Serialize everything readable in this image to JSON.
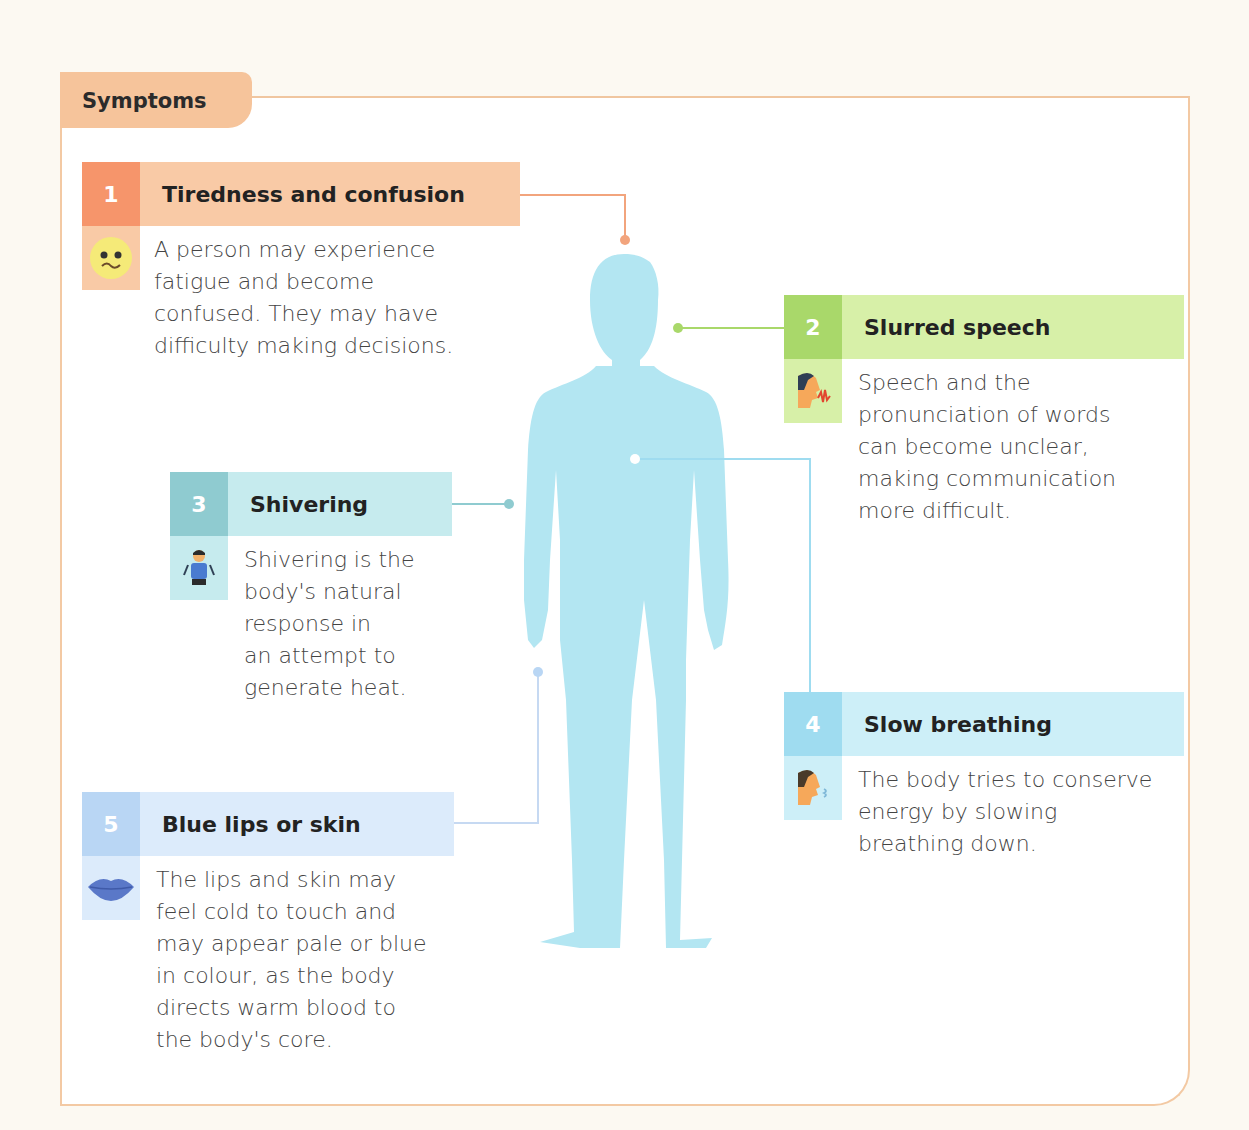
{
  "section": {
    "title": "Symptoms"
  },
  "colors": {
    "frame": "#f3c9a3",
    "body": "#b3e6f2",
    "orange": "#f6956b",
    "orange_light": "#f9caa6",
    "green": "#a9d86a",
    "green_light": "#d7f0a8",
    "teal": "#8fcbd0",
    "teal_light": "#c6ebee",
    "cyan": "#9fdcf0",
    "cyan_light": "#cdeff8",
    "blue": "#b9d6f4",
    "blue_light": "#dcebfb"
  },
  "symptoms": [
    {
      "number": "1",
      "title": "Tiredness and confusion",
      "icon": "confused-face-icon",
      "lines": [
        "A person may experience",
        "fatigue and become",
        "confused. They may have",
        "difficulty making decisions."
      ]
    },
    {
      "number": "2",
      "title": "Slurred speech",
      "icon": "speaking-head-icon",
      "lines": [
        "Speech and the",
        "pronunciation of words",
        "can become unclear,",
        "making communication",
        "more difficult."
      ]
    },
    {
      "number": "3",
      "title": "Shivering",
      "icon": "shivering-person-icon",
      "lines": [
        "Shivering is the",
        "body's natural",
        "response in",
        "an attempt to",
        "generate heat."
      ]
    },
    {
      "number": "4",
      "title": "Slow breathing",
      "icon": "breathing-head-icon",
      "lines": [
        "The body tries to conserve",
        "energy by slowing",
        "breathing down."
      ]
    },
    {
      "number": "5",
      "title": "Blue lips or skin",
      "icon": "blue-lips-icon",
      "lines": [
        "The lips and skin may",
        "feel cold to touch and",
        "may appear pale or blue",
        "in colour, as the body",
        "directs warm blood to",
        "the body's core."
      ]
    }
  ]
}
